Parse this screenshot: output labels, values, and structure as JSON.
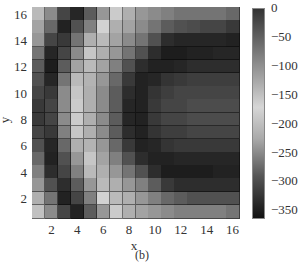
{
  "chart_data": {
    "type": "heatmap",
    "title": "",
    "caption": "(b)",
    "xlabel": "x",
    "ylabel": "y",
    "x": [
      1,
      2,
      3,
      4,
      5,
      6,
      7,
      8,
      9,
      10,
      11,
      12,
      13,
      14,
      15,
      16
    ],
    "y": [
      1,
      2,
      3,
      4,
      5,
      6,
      7,
      8,
      9,
      10,
      11,
      12,
      13,
      14,
      15,
      16
    ],
    "xticks": [
      2,
      4,
      6,
      8,
      10,
      12,
      14,
      16
    ],
    "yticks": [
      2,
      4,
      6,
      8,
      10,
      12,
      14,
      16
    ],
    "xlim": [
      0.5,
      16.5
    ],
    "ylim": [
      0.5,
      16.5
    ],
    "colorbar": {
      "ticks": [
        0,
        -50,
        -100,
        -150,
        -200,
        -250,
        -300,
        -350
      ],
      "range": [
        -365,
        0
      ],
      "colormap_note": "non-monotone grayscale: dark at 0, light near -170, black at -350"
    },
    "brightness_rows_top_to_bottom": [
      [
        0.75,
        0.55,
        0.25,
        0.12,
        0.35,
        0.6,
        0.82,
        0.7,
        0.6,
        0.55,
        0.5,
        0.45,
        0.45,
        0.45,
        0.45,
        0.4
      ],
      [
        0.65,
        0.4,
        0.1,
        0.3,
        0.5,
        0.85,
        0.7,
        0.65,
        0.55,
        0.45,
        0.35,
        0.3,
        0.28,
        0.25,
        0.25,
        0.2
      ],
      [
        0.6,
        0.25,
        0.2,
        0.45,
        0.7,
        0.75,
        0.65,
        0.55,
        0.45,
        0.3,
        0.15,
        0.12,
        0.12,
        0.12,
        0.12,
        0.1
      ],
      [
        0.45,
        0.12,
        0.25,
        0.55,
        0.8,
        0.7,
        0.6,
        0.45,
        0.3,
        0.15,
        0.08,
        0.08,
        0.1,
        0.1,
        0.12,
        0.12
      ],
      [
        0.35,
        0.08,
        0.35,
        0.65,
        0.75,
        0.65,
        0.5,
        0.3,
        0.15,
        0.1,
        0.1,
        0.12,
        0.15,
        0.15,
        0.15,
        0.15
      ],
      [
        0.3,
        0.12,
        0.45,
        0.75,
        0.72,
        0.6,
        0.4,
        0.2,
        0.1,
        0.12,
        0.18,
        0.2,
        0.22,
        0.22,
        0.22,
        0.22
      ],
      [
        0.25,
        0.2,
        0.55,
        0.8,
        0.7,
        0.55,
        0.35,
        0.15,
        0.1,
        0.18,
        0.22,
        0.25,
        0.25,
        0.25,
        0.25,
        0.25
      ],
      [
        0.2,
        0.25,
        0.55,
        0.82,
        0.7,
        0.55,
        0.35,
        0.12,
        0.1,
        0.2,
        0.25,
        0.25,
        0.28,
        0.28,
        0.28,
        0.28
      ],
      [
        0.2,
        0.25,
        0.55,
        0.82,
        0.7,
        0.55,
        0.35,
        0.12,
        0.1,
        0.2,
        0.25,
        0.25,
        0.28,
        0.28,
        0.28,
        0.28
      ],
      [
        0.25,
        0.2,
        0.5,
        0.8,
        0.7,
        0.55,
        0.35,
        0.15,
        0.1,
        0.18,
        0.22,
        0.22,
        0.25,
        0.25,
        0.25,
        0.25
      ],
      [
        0.3,
        0.12,
        0.4,
        0.7,
        0.72,
        0.6,
        0.4,
        0.2,
        0.1,
        0.12,
        0.18,
        0.2,
        0.2,
        0.2,
        0.2,
        0.2
      ],
      [
        0.4,
        0.1,
        0.3,
        0.6,
        0.8,
        0.65,
        0.5,
        0.3,
        0.15,
        0.1,
        0.1,
        0.12,
        0.12,
        0.12,
        0.12,
        0.12
      ],
      [
        0.5,
        0.15,
        0.25,
        0.5,
        0.75,
        0.7,
        0.6,
        0.45,
        0.3,
        0.15,
        0.08,
        0.08,
        0.08,
        0.08,
        0.1,
        0.1
      ],
      [
        0.6,
        0.3,
        0.15,
        0.35,
        0.6,
        0.75,
        0.7,
        0.6,
        0.5,
        0.35,
        0.2,
        0.15,
        0.15,
        0.15,
        0.15,
        0.15
      ],
      [
        0.7,
        0.45,
        0.1,
        0.25,
        0.5,
        0.85,
        0.75,
        0.7,
        0.6,
        0.5,
        0.4,
        0.35,
        0.3,
        0.3,
        0.3,
        0.3
      ],
      [
        0.78,
        0.55,
        0.25,
        0.1,
        0.35,
        0.6,
        0.82,
        0.7,
        0.65,
        0.6,
        0.55,
        0.5,
        0.5,
        0.5,
        0.5,
        0.45
      ]
    ]
  }
}
